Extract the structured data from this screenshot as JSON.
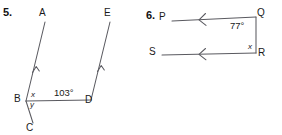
{
  "page": {
    "background_color": "#ffffff",
    "line_color": "#5a5a60",
    "text_color": "#1a1a1a"
  },
  "problems": [
    {
      "number": "5.",
      "description": "Two parallel rays cut by a transversal; angle at D is 103 degrees, angles x and y at B",
      "points": [
        {
          "name": "A",
          "x": 43,
          "y": 14
        },
        {
          "name": "E",
          "x": 108,
          "y": 14
        },
        {
          "name": "B",
          "x": 19,
          "y": 99
        },
        {
          "name": "C",
          "x": 30,
          "y": 128
        },
        {
          "name": "D",
          "x": 88,
          "y": 100
        }
      ],
      "angles": [
        {
          "label": "103°",
          "x": 57,
          "y": 92
        },
        {
          "label": "x",
          "x": 32,
          "y": 94
        },
        {
          "label": "y",
          "x": 31,
          "y": 104
        }
      ],
      "parallel_marks": 1
    },
    {
      "number": "6.",
      "description": "Two parallel arrowed lines PQ and SR with transversal QR; angle at Q is 77 degrees, angle x at R",
      "points": [
        {
          "name": "P",
          "x": 22,
          "y": 18
        },
        {
          "name": "Q",
          "x": 118,
          "y": 14
        },
        {
          "name": "S",
          "x": 12,
          "y": 53
        },
        {
          "name": "R",
          "x": 119,
          "y": 52
        }
      ],
      "angles": [
        {
          "label": "77°",
          "x": 93,
          "y": 23
        },
        {
          "label": "x",
          "x": 108,
          "y": 45
        }
      ],
      "parallel_marks": 1
    }
  ]
}
